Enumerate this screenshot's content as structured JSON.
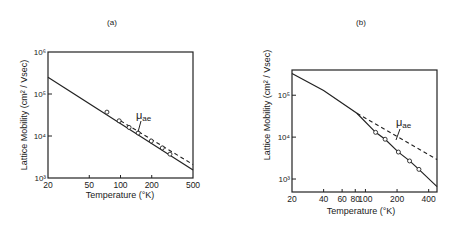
{
  "chart_data": [
    {
      "type": "line",
      "panel_label": "(a)",
      "title": "(a)",
      "xlabel": "Temperature (°K)",
      "ylabel": "Lattice  Mobility  (cm² / Vsec)",
      "xscale": "log",
      "yscale": "log",
      "xlim": [
        20,
        500
      ],
      "ylim": [
        1000,
        1000000
      ],
      "xticks": [
        20,
        50,
        100,
        200,
        500
      ],
      "xtick_labels": [
        "20",
        "50",
        "100",
        "200",
        "500"
      ],
      "yticks": [
        1000,
        10000,
        100000,
        1000000
      ],
      "ytick_labels": [
        "10³",
        "10⁴",
        "10⁵",
        "10⁶"
      ],
      "grid": false,
      "annotation": {
        "text": "μae",
        "base": "μ",
        "sub": "ae",
        "points_to": "dashed curve"
      },
      "series": [
        {
          "name": "calculated lattice mobility",
          "style": "solid",
          "x": [
            20,
            500
          ],
          "y": [
            250000,
            1550
          ]
        },
        {
          "name": "μae (acoustic, extrapolated)",
          "style": "dashed",
          "x": [
            100,
            500
          ],
          "y": [
            23000,
            2100
          ]
        },
        {
          "name": "experimental",
          "style": "markers",
          "x": [
            74,
            97,
            121,
            148,
            198,
            253,
            300
          ],
          "y": [
            37000,
            23000,
            16000,
            11800,
            7600,
            5200,
            3700
          ]
        }
      ]
    },
    {
      "type": "line",
      "panel_label": "(b)",
      "title": "(b)",
      "xlabel": "Temperature (°K)",
      "ylabel": "Lattice  Mobility  (cm² / Vsec)",
      "xscale": "log",
      "yscale": "log",
      "xlim": [
        20,
        480
      ],
      "ylim": [
        490,
        400000
      ],
      "xticks": [
        20,
        40,
        60,
        80,
        100,
        200,
        400
      ],
      "xtick_labels": [
        "20",
        "40",
        "60",
        "80",
        "100",
        "200",
        "400"
      ],
      "yticks": [
        1000,
        10000,
        100000
      ],
      "ytick_labels": [
        "10³",
        "10⁴",
        "10⁵"
      ],
      "grid": false,
      "annotation": {
        "text": "μae",
        "base": "μ",
        "sub": "ae",
        "points_to": "dashed curve"
      },
      "series": [
        {
          "name": "calculated lattice mobility",
          "style": "solid",
          "x": [
            20,
            40,
            83,
            125,
            154,
            206,
            263,
            323,
            480
          ],
          "y": [
            330000,
            130000,
            37000,
            13000,
            8900,
            4400,
            2700,
            1700,
            660
          ]
        },
        {
          "name": "μae (acoustic, extrapolated)",
          "style": "dashed",
          "x": [
            83,
            480
          ],
          "y": [
            37000,
            2900
          ]
        },
        {
          "name": "experimental",
          "style": "markers",
          "x": [
            125,
            154,
            206,
            263,
            323
          ],
          "y": [
            13000,
            8900,
            4400,
            2700,
            1700
          ]
        }
      ]
    }
  ],
  "panels": {
    "a": {
      "label": "(a)",
      "xlabel": "Temperature (°K)",
      "ylabel": "Lattice  Mobility  (cm² / Vsec)",
      "annotation_base": "μ",
      "annotation_sub": "ae"
    },
    "b": {
      "label": "(b)",
      "xlabel": "Temperature (°K)",
      "ylabel": "Lattice  Mobility  (cm² / Vsec)",
      "annotation_base": "μ",
      "annotation_sub": "ae"
    }
  }
}
